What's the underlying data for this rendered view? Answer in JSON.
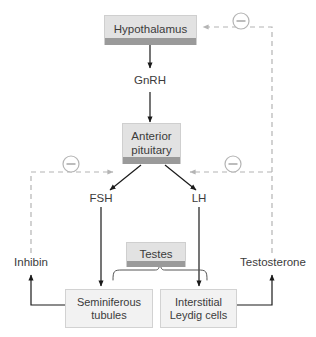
{
  "diagram": {
    "colors": {
      "text": "#3b3b3b",
      "solid_line": "#1a1a1a",
      "dashed_line": "#b4b4b4",
      "box_fill_shaded": "#e2e2e2",
      "box_fill_pale": "#f2f2f2",
      "box_base_strip": "#9a9a9a",
      "background": "#ffffff"
    },
    "nodes": [
      {
        "id": "hypothalamus",
        "label": "Hypothalamus",
        "style": "shaded"
      },
      {
        "id": "anterior-pituitary",
        "label": "Anterior\npituitary",
        "line1": "Anterior",
        "line2": "pituitary",
        "style": "shaded"
      },
      {
        "id": "testes",
        "label": "Testes",
        "style": "shaded"
      },
      {
        "id": "seminiferous-tubules",
        "line1": "Seminiferous",
        "line2": "tubules",
        "style": "pale"
      },
      {
        "id": "interstitial-leydig-cells",
        "line1": "Interstitial",
        "line2": "Leydig cells",
        "style": "pale"
      }
    ],
    "labels": {
      "gnrh": "GnRH",
      "fsh": "FSH",
      "lh": "LH",
      "inhibin": "Inhibin",
      "testosterone": "Testosterone"
    },
    "feedback_symbols": [
      {
        "id": "minus-top-right",
        "symbol": "−",
        "meaning": "negative feedback to hypothalamus"
      },
      {
        "id": "minus-mid-left",
        "symbol": "−",
        "meaning": "negative feedback by inhibin to anterior pituitary"
      },
      {
        "id": "minus-mid-right",
        "symbol": "−",
        "meaning": "negative feedback by testosterone to anterior pituitary"
      }
    ],
    "edges": [
      {
        "from": "hypothalamus",
        "to": "anterior-pituitary",
        "via": "GnRH",
        "type": "solid-stimulate"
      },
      {
        "from": "anterior-pituitary",
        "to": "FSH",
        "type": "solid-stimulate"
      },
      {
        "from": "anterior-pituitary",
        "to": "LH",
        "type": "solid-stimulate"
      },
      {
        "from": "FSH",
        "to": "seminiferous-tubules",
        "type": "solid-stimulate"
      },
      {
        "from": "LH",
        "to": "interstitial-leydig-cells",
        "type": "solid-stimulate"
      },
      {
        "from": "seminiferous-tubules",
        "to": "Inhibin",
        "type": "solid-produce"
      },
      {
        "from": "interstitial-leydig-cells",
        "to": "Testosterone",
        "type": "solid-produce"
      },
      {
        "from": "Inhibin",
        "to": "anterior-pituitary",
        "type": "dashed-inhibit"
      },
      {
        "from": "Testosterone",
        "to": "anterior-pituitary",
        "type": "dashed-inhibit"
      },
      {
        "from": "Testosterone",
        "to": "hypothalamus",
        "type": "dashed-inhibit"
      }
    ]
  }
}
